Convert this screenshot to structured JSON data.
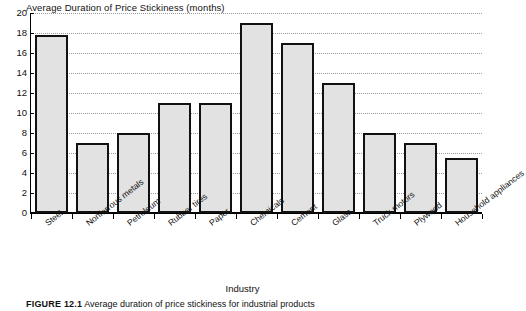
{
  "chart_data": {
    "type": "bar",
    "title": "Average Duration of Price Stickiness (months)",
    "xlabel": "Industry",
    "ylabel": "",
    "ylim": [
      0,
      20
    ],
    "ytick_step": 2,
    "yticks": [
      "20",
      "18",
      "16",
      "14",
      "12",
      "10",
      "8",
      "6",
      "4",
      "2",
      "0"
    ],
    "grid": true,
    "legend": "none",
    "categories": [
      "Steel",
      "Nonferrous metals",
      "Petroleum",
      "Rubber tires",
      "Paper",
      "Chemicals",
      "Cement",
      "Glass",
      "Truck motors",
      "Plywood",
      "Household appliances"
    ],
    "values": [
      17.8,
      7.0,
      8.0,
      11.0,
      11.0,
      19.0,
      17.0,
      13.0,
      8.0,
      7.0,
      5.5
    ],
    "bar_fill_color": "#e2e2e2",
    "bar_edge_color": "#111111"
  },
  "caption": {
    "label": "FIGURE 12.1",
    "text": "Average duration of price stickiness for industrial products"
  }
}
